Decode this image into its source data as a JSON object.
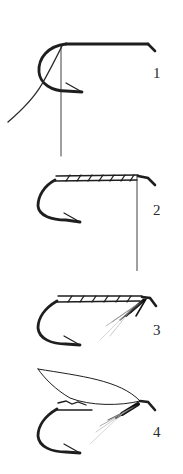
{
  "diagram": {
    "title": "",
    "background": "#ffffff",
    "ink_color": "#1e1e1e",
    "steps": [
      {
        "label": "1",
        "description": "bare hook with thread attached, thread hanging"
      },
      {
        "label": "2",
        "description": "thread wrapped along shank, thread hanging at eye"
      },
      {
        "label": "3",
        "description": "body wrapped, hackle fibers tied in at throat"
      },
      {
        "label": "4",
        "description": "wing tied on top, completed wet fly"
      }
    ]
  }
}
